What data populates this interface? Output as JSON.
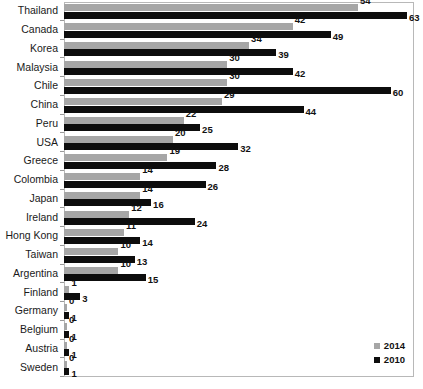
{
  "chart_data": {
    "type": "bar",
    "orientation": "horizontal",
    "title": "",
    "subtitle": "",
    "xlabel": "",
    "ylabel": "",
    "grid": false,
    "legend_position": "bottom-right",
    "xlim": [
      0,
      63
    ],
    "categories": [
      "Thailand",
      "Canada",
      "Korea",
      "Malaysia",
      "Chile",
      "China",
      "Peru",
      "USA",
      "Greece",
      "Colombia",
      "Japan",
      "Ireland",
      "Hong Kong",
      "Taiwan",
      "Argentina",
      "Finland",
      "Germany",
      "Belgium",
      "Austria",
      "Sweden"
    ],
    "series": [
      {
        "name": "2014",
        "color": "#a6a6a6",
        "values": [
          54,
          42,
          34,
          30,
          30,
          29,
          22,
          20,
          19,
          14,
          14,
          12,
          11,
          10,
          10,
          1,
          0,
          0,
          0,
          0
        ]
      },
      {
        "name": "2010",
        "color": "#0d0d0d",
        "values": [
          63,
          49,
          39,
          42,
          60,
          44,
          25,
          32,
          28,
          26,
          16,
          24,
          14,
          13,
          15,
          3,
          1,
          1,
          1,
          1
        ]
      }
    ],
    "legend": [
      {
        "label": "2014",
        "color": "#a6a6a6"
      },
      {
        "label": "2010",
        "color": "#0d0d0d"
      }
    ]
  }
}
